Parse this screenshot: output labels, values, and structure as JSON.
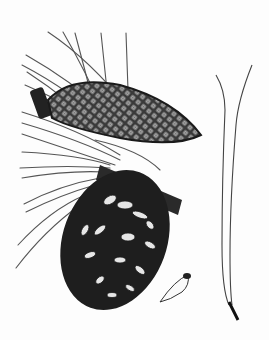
{
  "illustration": {
    "subject": "pine branch botanical drawing",
    "style": "pen-and-ink",
    "background_color": "#fdfdfd",
    "ink_color": "#1a1a1a",
    "parts": [
      {
        "name": "closed-cone",
        "description": "elongated closed pine cone with diamond scale pattern"
      },
      {
        "name": "open-cone",
        "description": "mature opened pine cone with spreading scales"
      },
      {
        "name": "needles",
        "description": "long thin needles radiating from branch"
      },
      {
        "name": "seed",
        "description": "winged pine seed"
      },
      {
        "name": "needle-fascicle",
        "description": "pair of needles joined at a dark sheath"
      }
    ]
  }
}
